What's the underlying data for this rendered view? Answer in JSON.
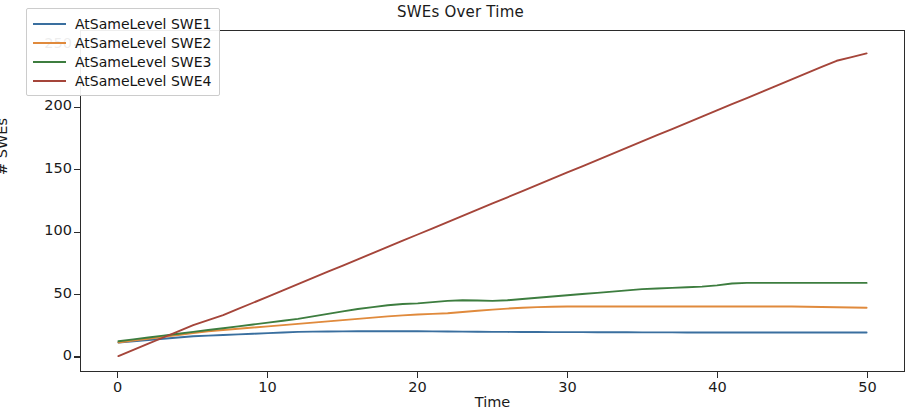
{
  "chart_data": {
    "type": "line",
    "title": "SWEs Over Time",
    "xlabel": "Time",
    "ylabel": "# SWEs",
    "xlim": [
      -2.5,
      52.5
    ],
    "ylim": [
      -12,
      262
    ],
    "xticks": [
      0,
      10,
      20,
      30,
      40,
      50
    ],
    "xtick_labels": [
      "0",
      "10",
      "20",
      "30",
      "40",
      "50"
    ],
    "yticks": [
      0,
      50,
      100,
      150,
      200,
      250
    ],
    "ytick_labels": [
      "0",
      "50",
      "100",
      "150",
      "200",
      "250"
    ],
    "grid": false,
    "legend_position": "upper left",
    "x": [
      0,
      1,
      2,
      3,
      4,
      5,
      6,
      7,
      8,
      9,
      10,
      11,
      12,
      13,
      14,
      15,
      16,
      17,
      18,
      19,
      20,
      21,
      22,
      23,
      24,
      25,
      26,
      27,
      28,
      29,
      30,
      31,
      32,
      33,
      34,
      35,
      36,
      37,
      38,
      39,
      40,
      41,
      42,
      43,
      44,
      45,
      46,
      47,
      48,
      49,
      50
    ],
    "series": [
      {
        "name": "AtSameLevel SWE1",
        "color": "#3a6f9f",
        "values": [
          11,
          12,
          13,
          14,
          15,
          16,
          16.5,
          17,
          17.5,
          18,
          18.5,
          19,
          19.5,
          19.7,
          19.8,
          19.9,
          20,
          20,
          20,
          20,
          20,
          19.9,
          19.8,
          19.7,
          19.6,
          19.5,
          19.5,
          19.4,
          19.4,
          19.3,
          19.3,
          19.3,
          19.2,
          19.2,
          19.2,
          19.1,
          19.1,
          19.1,
          19,
          19,
          19,
          19,
          19,
          19,
          19,
          19,
          19,
          19,
          19,
          19,
          19
        ]
      },
      {
        "name": "AtSameLevel SWE2",
        "color": "#e08a3c",
        "values": [
          11,
          12.5,
          14,
          15.5,
          17,
          18.5,
          20,
          21,
          22,
          23,
          24,
          25,
          26,
          27,
          28,
          29,
          30,
          31,
          32,
          32.8,
          33.5,
          34,
          34.5,
          35.5,
          36.5,
          37.5,
          38.3,
          39,
          39.5,
          39.8,
          40,
          40,
          40,
          40,
          40,
          40,
          40,
          40,
          40,
          40,
          40,
          40,
          40,
          40,
          40,
          40,
          39.8,
          39.6,
          39.4,
          39.2,
          39
        ]
      },
      {
        "name": "AtSameLevel SWE3",
        "color": "#3d7d3f",
        "values": [
          12,
          13.5,
          15,
          16.5,
          18,
          19.5,
          21,
          22.5,
          24,
          25.5,
          27,
          28.5,
          30,
          32,
          34,
          36,
          38,
          39.5,
          41,
          42,
          42.5,
          43.5,
          44.5,
          45,
          44.8,
          44.5,
          45,
          46,
          47,
          48,
          49,
          50,
          51,
          52,
          53,
          54,
          54.5,
          55,
          55.5,
          56,
          57,
          58.5,
          59,
          59,
          59,
          59,
          59,
          59,
          59,
          59,
          59
        ]
      },
      {
        "name": "AtSameLevel SWE4",
        "color": "#a5453a",
        "values": [
          0,
          5,
          10,
          15,
          20,
          25,
          29,
          33,
          38,
          43,
          48,
          53,
          58,
          63,
          68,
          73,
          78,
          83,
          88,
          93,
          98,
          103,
          108,
          113,
          118,
          123,
          128,
          133,
          138,
          143,
          148,
          153,
          158,
          163,
          168,
          173,
          178,
          183,
          188,
          193,
          198,
          203,
          208,
          213,
          218,
          223,
          228,
          233,
          238,
          241,
          244
        ]
      }
    ]
  },
  "axes": {
    "title": "SWEs Over Time",
    "xlabel": "Time",
    "ylabel": "# SWEs"
  },
  "legend": {
    "items": [
      {
        "label": "AtSameLevel SWE1"
      },
      {
        "label": "AtSameLevel SWE2"
      },
      {
        "label": "AtSameLevel SWE3"
      },
      {
        "label": "AtSameLevel SWE4"
      }
    ]
  }
}
